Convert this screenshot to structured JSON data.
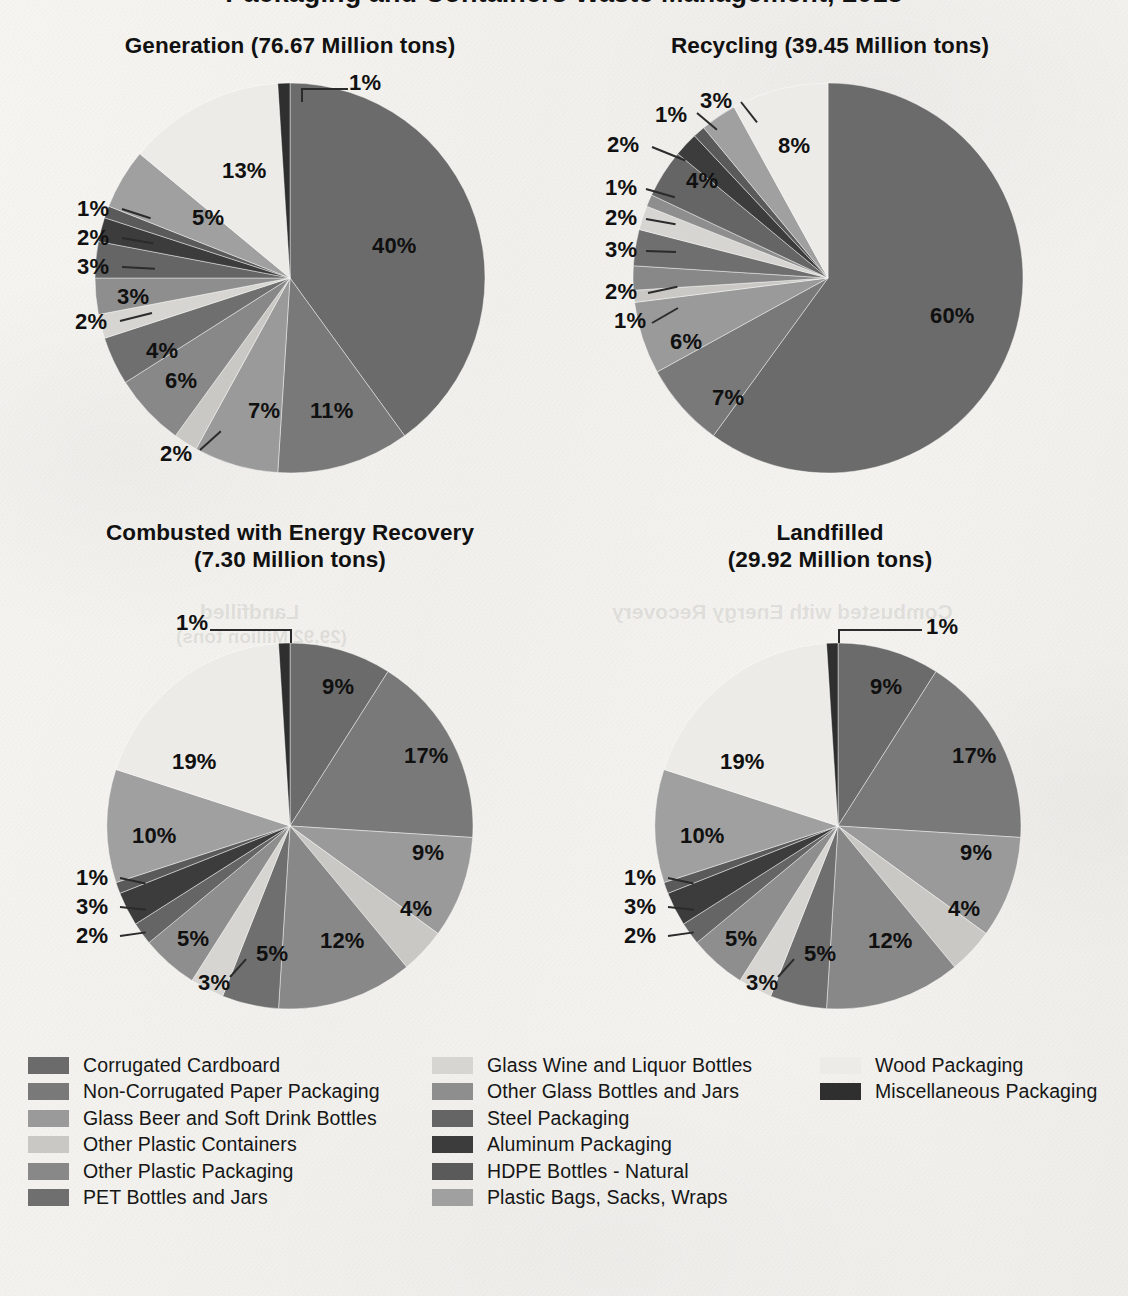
{
  "document": {
    "clipped_heading": "Packaging and Containers Waste Management, 2018"
  },
  "legend": {
    "columns": [
      {
        "x": 28,
        "text_x": 83,
        "items": [
          {
            "label": "Corrugated Cardboard",
            "color": "#6b6b6b"
          },
          {
            "label": "Non-Corrugated Paper Packaging",
            "color": "#797979"
          },
          {
            "label": "Glass Beer and Soft Drink Bottles",
            "color": "#9a9a9a"
          },
          {
            "label": "Other Plastic Containers",
            "color": "#c9c8c4"
          },
          {
            "label": "Other Plastic Packaging",
            "color": "#888888"
          },
          {
            "label": "PET Bottles and Jars",
            "color": "#6f6f6f"
          }
        ]
      },
      {
        "x": 432,
        "text_x": 487,
        "items": [
          {
            "label": "Glass Wine and Liquor Bottles",
            "color": "#d6d5d1"
          },
          {
            "label": "Other Glass Bottles and Jars",
            "color": "#8e8e8e"
          },
          {
            "label": "Steel Packaging",
            "color": "#656565"
          },
          {
            "label": "Aluminum Packaging",
            "color": "#3c3c3c"
          },
          {
            "label": "HDPE Bottles - Natural",
            "color": "#5a5a5a"
          },
          {
            "label": "Plastic Bags, Sacks, Wraps",
            "color": "#a0a0a0"
          }
        ]
      },
      {
        "x": 820,
        "text_x": 875,
        "items": [
          {
            "label": "Wood Packaging",
            "color": "#ecebe7"
          },
          {
            "label": "Miscellaneous Packaging",
            "color": "#2f2f2f"
          }
        ]
      }
    ]
  },
  "chart_data": [
    {
      "id": "generation",
      "type": "pie",
      "title": "Generation (76.67 Million tons)",
      "total_label": "76.67 Million tons",
      "center": {
        "x": 290,
        "y": 278
      },
      "radius": 195,
      "start_angle_deg": -90,
      "categories": [
        "Corrugated Cardboard",
        "Non-Corrugated Paper Packaging",
        "Glass Beer and Soft Drink Bottles",
        "Other Plastic Containers",
        "Other Plastic Packaging",
        "PET Bottles and Jars",
        "Glass Wine and Liquor Bottles",
        "Other Glass Bottles and Jars",
        "Steel Packaging",
        "Aluminum Packaging",
        "HDPE Bottles - Natural",
        "Plastic Bags, Sacks, Wraps",
        "Wood Packaging",
        "Miscellaneous Packaging"
      ],
      "values": [
        40,
        11,
        7,
        2,
        6,
        4,
        2,
        3,
        3,
        2,
        1,
        5,
        13,
        1
      ],
      "colors": [
        "#6b6b6b",
        "#797979",
        "#9a9a9a",
        "#c9c8c4",
        "#888888",
        "#6f6f6f",
        "#d6d5d1",
        "#8e8e8e",
        "#656565",
        "#3c3c3c",
        "#5a5a5a",
        "#a0a0a0",
        "#ecebe7",
        "#2f2f2f"
      ],
      "labels": [
        {
          "text": "40%",
          "x": 372,
          "y": 235,
          "inside": true
        },
        {
          "text": "11%",
          "x": 310,
          "y": 400,
          "inside": true
        },
        {
          "text": "7%",
          "x": 248,
          "y": 400,
          "inside": true
        },
        {
          "text": "2%",
          "x": 160,
          "y": 443,
          "inside": false
        },
        {
          "text": "6%",
          "x": 165,
          "y": 370,
          "inside": true
        },
        {
          "text": "4%",
          "x": 146,
          "y": 340,
          "inside": true
        },
        {
          "text": "2%",
          "x": 75,
          "y": 311,
          "inside": false
        },
        {
          "text": "3%",
          "x": 117,
          "y": 286,
          "inside": true
        },
        {
          "text": "3%",
          "x": 77,
          "y": 256,
          "inside": false
        },
        {
          "text": "2%",
          "x": 77,
          "y": 227,
          "inside": false
        },
        {
          "text": "1%",
          "x": 77,
          "y": 198,
          "inside": false
        },
        {
          "text": "5%",
          "x": 192,
          "y": 207,
          "inside": true
        },
        {
          "text": "13%",
          "x": 222,
          "y": 160,
          "inside": true
        },
        {
          "text": "1%",
          "x": 349,
          "y": 72,
          "inside": false
        }
      ],
      "leaders": [
        {
          "x": 303,
          "y": 88,
          "w": 45,
          "h": 2,
          "type": "h"
        },
        {
          "x": 301,
          "y": 88,
          "w": 2,
          "h": 14,
          "type": "v"
        },
        {
          "x": 122,
          "y": 208,
          "w": 30,
          "h": 2,
          "type": "h",
          "rot": 18
        },
        {
          "x": 122,
          "y": 237,
          "w": 32,
          "h": 2,
          "type": "h",
          "rot": 10
        },
        {
          "x": 122,
          "y": 266,
          "w": 33,
          "h": 2,
          "type": "h",
          "rot": 3
        },
        {
          "x": 120,
          "y": 320,
          "w": 33,
          "h": 2,
          "type": "h",
          "rot": -14
        },
        {
          "x": 200,
          "y": 449,
          "w": 28,
          "h": 2,
          "type": "h",
          "rot": -42
        }
      ]
    },
    {
      "id": "recycling",
      "type": "pie",
      "title": "Recycling (39.45 Million tons)",
      "total_label": "39.45 Million tons",
      "center": {
        "x": 828,
        "y": 278
      },
      "radius": 195,
      "start_angle_deg": -90,
      "categories": [
        "Corrugated Cardboard",
        "Non-Corrugated Paper Packaging",
        "Glass Beer and Soft Drink Bottles",
        "Other Plastic Containers",
        "Other Plastic Packaging",
        "PET Bottles and Jars",
        "Glass Wine and Liquor Bottles",
        "Other Glass Bottles and Jars",
        "Steel Packaging",
        "Aluminum Packaging",
        "HDPE Bottles - Natural",
        "Plastic Bags, Sacks, Wraps",
        "Wood Packaging",
        "Miscellaneous Packaging"
      ],
      "values": [
        60,
        7,
        6,
        1,
        2,
        3,
        2,
        1,
        4,
        2,
        1,
        3,
        8,
        0
      ],
      "colors": [
        "#6b6b6b",
        "#797979",
        "#9a9a9a",
        "#c9c8c4",
        "#888888",
        "#6f6f6f",
        "#d6d5d1",
        "#8e8e8e",
        "#656565",
        "#3c3c3c",
        "#5a5a5a",
        "#a0a0a0",
        "#ecebe7",
        "#2f2f2f"
      ],
      "labels": [
        {
          "text": "60%",
          "x": 930,
          "y": 305,
          "inside": true
        },
        {
          "text": "7%",
          "x": 712,
          "y": 387,
          "inside": true
        },
        {
          "text": "6%",
          "x": 670,
          "y": 331,
          "inside": true
        },
        {
          "text": "1%",
          "x": 614,
          "y": 310,
          "inside": false
        },
        {
          "text": "2%",
          "x": 605,
          "y": 281,
          "inside": false
        },
        {
          "text": "3%",
          "x": 605,
          "y": 239,
          "inside": false
        },
        {
          "text": "2%",
          "x": 605,
          "y": 207,
          "inside": false
        },
        {
          "text": "1%",
          "x": 605,
          "y": 177,
          "inside": false
        },
        {
          "text": "4%",
          "x": 686,
          "y": 170,
          "inside": true
        },
        {
          "text": "2%",
          "x": 607,
          "y": 134,
          "inside": false
        },
        {
          "text": "1%",
          "x": 655,
          "y": 104,
          "inside": false
        },
        {
          "text": "3%",
          "x": 700,
          "y": 90,
          "inside": false
        },
        {
          "text": "8%",
          "x": 778,
          "y": 135,
          "inside": true
        }
      ],
      "leaders": [
        {
          "x": 652,
          "y": 322,
          "w": 30,
          "h": 2,
          "type": "h",
          "rot": -30
        },
        {
          "x": 648,
          "y": 292,
          "w": 30,
          "h": 2,
          "type": "h",
          "rot": -12
        },
        {
          "x": 646,
          "y": 250,
          "w": 30,
          "h": 2,
          "type": "h",
          "rot": 2
        },
        {
          "x": 646,
          "y": 218,
          "w": 30,
          "h": 2,
          "type": "h",
          "rot": 10
        },
        {
          "x": 646,
          "y": 188,
          "w": 30,
          "h": 2,
          "type": "h",
          "rot": 16
        },
        {
          "x": 652,
          "y": 146,
          "w": 36,
          "h": 2,
          "type": "h",
          "rot": 22
        },
        {
          "x": 697,
          "y": 112,
          "w": 26,
          "h": 2,
          "type": "h",
          "rot": 40
        },
        {
          "x": 741,
          "y": 101,
          "w": 26,
          "h": 2,
          "type": "h",
          "rot": 52
        }
      ]
    },
    {
      "id": "combusted",
      "type": "pie",
      "title_line1": "Combusted with Energy Recovery",
      "title_line2": "(7.30 Million tons)",
      "title": "Combusted with Energy Recovery (7.30 Million tons)",
      "total_label": "7.30 Million tons",
      "center": {
        "x": 290,
        "y": 826
      },
      "radius": 183,
      "start_angle_deg": -90,
      "categories": [
        "Corrugated Cardboard",
        "Non-Corrugated Paper Packaging",
        "Glass Beer and Soft Drink Bottles",
        "Other Plastic Containers",
        "Other Plastic Packaging",
        "PET Bottles and Jars",
        "Glass Wine and Liquor Bottles",
        "Other Glass Bottles and Jars",
        "Steel Packaging",
        "Aluminum Packaging",
        "HDPE Bottles - Natural",
        "Plastic Bags, Sacks, Wraps",
        "Wood Packaging",
        "Miscellaneous Packaging"
      ],
      "values": [
        9,
        17,
        9,
        4,
        12,
        5,
        3,
        5,
        2,
        3,
        1,
        10,
        19,
        1
      ],
      "colors": [
        "#6b6b6b",
        "#797979",
        "#9a9a9a",
        "#c9c8c4",
        "#888888",
        "#6f6f6f",
        "#d6d5d1",
        "#8e8e8e",
        "#656565",
        "#3c3c3c",
        "#5a5a5a",
        "#a0a0a0",
        "#ecebe7",
        "#2f2f2f"
      ],
      "labels": [
        {
          "text": "9%",
          "x": 322,
          "y": 676,
          "inside": true
        },
        {
          "text": "17%",
          "x": 404,
          "y": 745,
          "inside": true
        },
        {
          "text": "9%",
          "x": 412,
          "y": 842,
          "inside": true
        },
        {
          "text": "4%",
          "x": 400,
          "y": 898,
          "inside": true
        },
        {
          "text": "12%",
          "x": 320,
          "y": 930,
          "inside": true
        },
        {
          "text": "5%",
          "x": 256,
          "y": 943,
          "inside": true
        },
        {
          "text": "3%",
          "x": 198,
          "y": 972,
          "inside": false
        },
        {
          "text": "5%",
          "x": 177,
          "y": 928,
          "inside": true
        },
        {
          "text": "2%",
          "x": 76,
          "y": 925,
          "inside": false
        },
        {
          "text": "3%",
          "x": 76,
          "y": 896,
          "inside": false
        },
        {
          "text": "1%",
          "x": 76,
          "y": 867,
          "inside": false
        },
        {
          "text": "10%",
          "x": 132,
          "y": 825,
          "inside": true
        },
        {
          "text": "19%",
          "x": 172,
          "y": 751,
          "inside": true
        },
        {
          "text": "1%",
          "x": 176,
          "y": 612,
          "inside": false
        }
      ],
      "leaders": [
        {
          "x": 210,
          "y": 629,
          "w": 82,
          "h": 2,
          "type": "h"
        },
        {
          "x": 290,
          "y": 629,
          "w": 2,
          "h": 14,
          "type": "v"
        },
        {
          "x": 120,
          "y": 877,
          "w": 26,
          "h": 2,
          "type": "h",
          "rot": 12
        },
        {
          "x": 120,
          "y": 906,
          "w": 26,
          "h": 2,
          "type": "h",
          "rot": 6
        },
        {
          "x": 120,
          "y": 935,
          "w": 26,
          "h": 2,
          "type": "h",
          "rot": -8
        },
        {
          "x": 230,
          "y": 976,
          "w": 24,
          "h": 2,
          "type": "h",
          "rot": -48
        }
      ]
    },
    {
      "id": "landfilled",
      "type": "pie",
      "title_line1": "Landfilled",
      "title_line2": "(29.92 Million tons)",
      "title": "Landfilled (29.92 Million tons)",
      "total_label": "29.92 Million tons",
      "center": {
        "x": 838,
        "y": 826
      },
      "radius": 183,
      "start_angle_deg": -90,
      "categories": [
        "Corrugated Cardboard",
        "Non-Corrugated Paper Packaging",
        "Glass Beer and Soft Drink Bottles",
        "Other Plastic Containers",
        "Other Plastic Packaging",
        "PET Bottles and Jars",
        "Glass Wine and Liquor Bottles",
        "Other Glass Bottles and Jars",
        "Steel Packaging",
        "Aluminum Packaging",
        "HDPE Bottles - Natural",
        "Plastic Bags, Sacks, Wraps",
        "Wood Packaging",
        "Miscellaneous Packaging"
      ],
      "values": [
        9,
        17,
        9,
        4,
        12,
        5,
        3,
        5,
        2,
        3,
        1,
        10,
        19,
        1
      ],
      "colors": [
        "#6b6b6b",
        "#797979",
        "#9a9a9a",
        "#c9c8c4",
        "#888888",
        "#6f6f6f",
        "#d6d5d1",
        "#8e8e8e",
        "#656565",
        "#3c3c3c",
        "#5a5a5a",
        "#a0a0a0",
        "#ecebe7",
        "#2f2f2f"
      ],
      "labels": [
        {
          "text": "9%",
          "x": 870,
          "y": 676,
          "inside": true
        },
        {
          "text": "17%",
          "x": 952,
          "y": 745,
          "inside": true
        },
        {
          "text": "9%",
          "x": 960,
          "y": 842,
          "inside": true
        },
        {
          "text": "4%",
          "x": 948,
          "y": 898,
          "inside": true
        },
        {
          "text": "12%",
          "x": 868,
          "y": 930,
          "inside": true
        },
        {
          "text": "5%",
          "x": 804,
          "y": 943,
          "inside": true
        },
        {
          "text": "3%",
          "x": 746,
          "y": 972,
          "inside": false
        },
        {
          "text": "5%",
          "x": 725,
          "y": 928,
          "inside": true
        },
        {
          "text": "2%",
          "x": 624,
          "y": 925,
          "inside": false
        },
        {
          "text": "3%",
          "x": 624,
          "y": 896,
          "inside": false
        },
        {
          "text": "1%",
          "x": 624,
          "y": 867,
          "inside": false
        },
        {
          "text": "10%",
          "x": 680,
          "y": 825,
          "inside": true
        },
        {
          "text": "19%",
          "x": 720,
          "y": 751,
          "inside": true
        },
        {
          "text": "1%",
          "x": 926,
          "y": 616,
          "inside": false
        }
      ],
      "leaders": [
        {
          "x": 838,
          "y": 629,
          "w": 84,
          "h": 2,
          "type": "h"
        },
        {
          "x": 838,
          "y": 629,
          "w": 2,
          "h": 14,
          "type": "v"
        },
        {
          "x": 668,
          "y": 877,
          "w": 26,
          "h": 2,
          "type": "h",
          "rot": 12
        },
        {
          "x": 668,
          "y": 906,
          "w": 26,
          "h": 2,
          "type": "h",
          "rot": 6
        },
        {
          "x": 668,
          "y": 935,
          "w": 26,
          "h": 2,
          "type": "h",
          "rot": -8
        },
        {
          "x": 778,
          "y": 976,
          "w": 24,
          "h": 2,
          "type": "h",
          "rot": -48
        }
      ]
    }
  ],
  "chart_titles": {
    "generation": {
      "x": 60,
      "y": 32,
      "w": 460
    },
    "recycling": {
      "x": 600,
      "y": 32,
      "w": 460
    },
    "combusted": {
      "x": 60,
      "y": 520,
      "w": 460
    },
    "landfilled": {
      "x": 600,
      "y": 520,
      "w": 460
    }
  },
  "ghost_text": {
    "line1": "Combusted with Energy Recovery",
    "line2": "Landfilled",
    "line3": "(29.92 Million tons)"
  }
}
